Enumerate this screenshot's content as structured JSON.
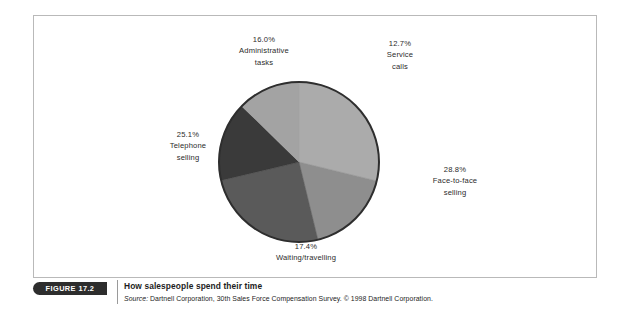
{
  "figure": {
    "tag": "FIGURE 17.2",
    "title": "How salespeople spend their time",
    "source_prefix": "Source:",
    "source_text": " Dartnell Corporation, 30th Sales Force Compensation Survey. © 1998 Dartnell Corporation."
  },
  "chart_data": {
    "type": "pie",
    "title": "How salespeople spend their time",
    "unit": "%",
    "grid": false,
    "legend": "none",
    "label_style": "outside-callout",
    "categories": [
      "Face-to-face selling",
      "Waiting/travelling",
      "Telephone selling",
      "Administrative tasks",
      "Service calls"
    ],
    "values": [
      28.8,
      17.4,
      25.1,
      16.0,
      12.7
    ],
    "slices": [
      {
        "label": "Face-to-face selling",
        "value": 28.8,
        "value_label": "28.8%",
        "color": "#ababab",
        "start_angle": 0,
        "end_angle": 103.68
      },
      {
        "label": "Waiting/travelling",
        "value": 17.4,
        "value_label": "17.4%",
        "color": "#8e8e8e",
        "start_angle": 103.68,
        "end_angle": 166.32
      },
      {
        "label": "Telephone selling",
        "value": 25.1,
        "value_label": "25.1%",
        "color": "#5a5a5a",
        "start_angle": 166.32,
        "end_angle": 256.68
      },
      {
        "label": "Administrative tasks",
        "value": 16.0,
        "value_label": "16.0%",
        "color": "#3a3a3a",
        "start_angle": 256.68,
        "end_angle": 314.28
      },
      {
        "label": "Service calls",
        "value": 12.7,
        "value_label": "12.7%",
        "color": "#a3a3a3",
        "start_angle": 314.28,
        "end_angle": 360
      }
    ]
  },
  "labels": {
    "administrative": {
      "pct": "16.0%",
      "line1": "Administrative",
      "line2": "tasks"
    },
    "service": {
      "pct": "12.7%",
      "line1": "Service",
      "line2": "calls"
    },
    "face_to_face": {
      "pct": "28.8%",
      "line1": "Face-to-face",
      "line2": "selling"
    },
    "telephone": {
      "pct": "25.1%",
      "line1": "Telephone",
      "line2": "selling"
    },
    "waiting": {
      "pct": "17.4%",
      "line1": "Waiting/travelling",
      "line2": ""
    }
  },
  "colors": {
    "frame_border": "#b9b9b9",
    "tag_background": "#2d2d2d",
    "pie_outline": "#2e2e2e",
    "text": "#2b2b2b"
  }
}
